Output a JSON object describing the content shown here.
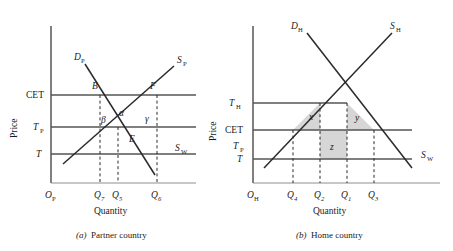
{
  "figure": {
    "background": "#ffffff",
    "line_color": "#2a2a2a",
    "shade_color": "#d6d6d6",
    "panels": [
      {
        "id": "partner",
        "caption_prefix": "(a)",
        "caption_text": "Partner country",
        "axis_y_title": "Price",
        "axis_x_title": "Quantity",
        "origin_label": "O",
        "origin_sub": "P",
        "price_levels": [
          {
            "label": "CET",
            "sub": "",
            "y": 95
          },
          {
            "label": "T",
            "sub": "P",
            "y": 127
          },
          {
            "label": "T",
            "sub": "",
            "y": 154
          }
        ],
        "quantity_ticks": [
          {
            "label": "Q",
            "sub": "7",
            "x": 100
          },
          {
            "label": "Q",
            "sub": "5",
            "x": 118
          },
          {
            "label": "Q",
            "sub": "6",
            "x": 157
          }
        ],
        "curves": [
          {
            "name": "D",
            "sub": "P",
            "label_x": 77,
            "label_y": 57
          },
          {
            "name": "S",
            "sub": "P",
            "label_x": 180,
            "label_y": 60
          },
          {
            "name": "S",
            "sub": "W",
            "label_x": 179,
            "label_y": 152
          }
        ],
        "points": [
          {
            "label": "B",
            "x": 95,
            "y": 87
          },
          {
            "label": "F",
            "x": 152,
            "y": 87
          },
          {
            "label": "E",
            "x": 130,
            "y": 140
          }
        ],
        "greek_areas": [
          {
            "label": "β",
            "x": 104,
            "y": 121
          },
          {
            "label": "α",
            "x": 122,
            "y": 114
          },
          {
            "label": "γ",
            "x": 148,
            "y": 120
          }
        ]
      },
      {
        "id": "home",
        "caption_prefix": "(b)",
        "caption_text": "Home country",
        "axis_y_title": "Price",
        "axis_x_title": "Quantity",
        "origin_label": "O",
        "origin_sub": "H",
        "price_levels": [
          {
            "label": "T",
            "sub": "H",
            "y": 77
          },
          {
            "label": "CET",
            "sub": "",
            "y": 108
          },
          {
            "label": "T",
            "sub": "P",
            "y": 130
          },
          {
            "label": "T",
            "sub": "",
            "y": 159
          }
        ],
        "quantity_ticks": [
          {
            "label": "Q",
            "sub": "4",
            "x": 293
          },
          {
            "label": "Q",
            "sub": "2",
            "x": 320
          },
          {
            "label": "Q",
            "sub": "1",
            "x": 347
          },
          {
            "label": "Q",
            "sub": "3",
            "x": 374
          }
        ],
        "curves": [
          {
            "name": "D",
            "sub": "H",
            "label_x": 296,
            "label_y": 26
          },
          {
            "name": "S",
            "sub": "H",
            "label_x": 390,
            "label_y": 26
          },
          {
            "name": "S",
            "sub": "W",
            "label_x": 423,
            "label_y": 157
          }
        ],
        "shaded_areas": [
          {
            "label": "x",
            "x": 312,
            "y": 97
          },
          {
            "label": "y",
            "x": 358,
            "y": 98
          },
          {
            "label": "z",
            "x": 332,
            "y": 137
          }
        ]
      }
    ]
  }
}
